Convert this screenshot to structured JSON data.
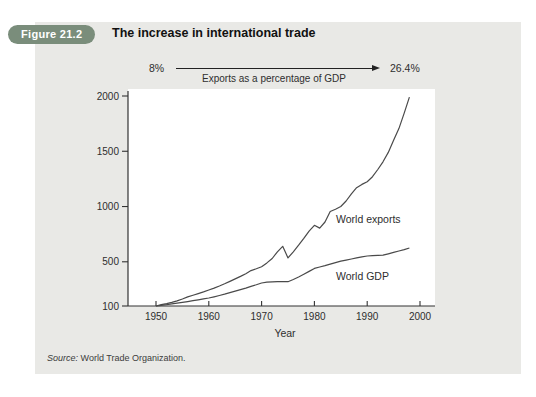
{
  "figure": {
    "badge": "Figure 21.2",
    "title": "The increase in international trade"
  },
  "arrow": {
    "start_label": "8%",
    "end_label": "26.4%",
    "caption": "Exports as a percentage of GDP"
  },
  "chart_data": {
    "type": "line",
    "title": "",
    "xlabel": "Year",
    "ylabel": "",
    "ylim": [
      100,
      2000
    ],
    "yticks": [
      100,
      500,
      1000,
      1500,
      2000
    ],
    "xticks": [
      1950,
      1960,
      1970,
      1980,
      1990,
      2000
    ],
    "grid": false,
    "legend": "inline-labels",
    "x": [
      1950,
      1951,
      1952,
      1953,
      1954,
      1955,
      1956,
      1957,
      1958,
      1959,
      1960,
      1961,
      1962,
      1963,
      1964,
      1965,
      1966,
      1967,
      1968,
      1969,
      1970,
      1971,
      1972,
      1973,
      1974,
      1975,
      1976,
      1977,
      1978,
      1979,
      1980,
      1981,
      1982,
      1983,
      1984,
      1985,
      1986,
      1987,
      1988,
      1989,
      1990,
      1991,
      1992,
      1993,
      1994,
      1995,
      1996,
      1997,
      1998
    ],
    "series": [
      {
        "name": "World exports",
        "values": [
          100,
          112,
          122,
          133,
          146,
          163,
          182,
          198,
          212,
          228,
          245,
          262,
          281,
          301,
          323,
          345,
          368,
          392,
          420,
          437,
          455,
          490,
          530,
          590,
          640,
          535,
          590,
          650,
          712,
          778,
          830,
          805,
          860,
          955,
          975,
          1000,
          1050,
          1115,
          1170,
          1200,
          1225,
          1270,
          1335,
          1405,
          1490,
          1600,
          1705,
          1845,
          1990
        ]
      },
      {
        "name": "World GDP",
        "values": [
          100,
          106,
          112,
          119,
          126,
          133,
          140,
          148,
          156,
          164,
          172,
          183,
          195,
          207,
          220,
          234,
          248,
          262,
          277,
          292,
          308,
          315,
          318,
          320,
          320,
          320,
          340,
          362,
          387,
          413,
          440,
          453,
          465,
          478,
          492,
          505,
          515,
          525,
          535,
          545,
          552,
          556,
          558,
          560,
          572,
          585,
          598,
          610,
          625
        ]
      }
    ]
  },
  "source": {
    "prefix": "Source:",
    "text": "World Trade Organization."
  },
  "colors": {
    "panel_bg": "#e9e9e6",
    "badge_bg": "#7a8d7b",
    "line": "#4a4a4a",
    "axis": "#333333",
    "text": "#222222"
  }
}
